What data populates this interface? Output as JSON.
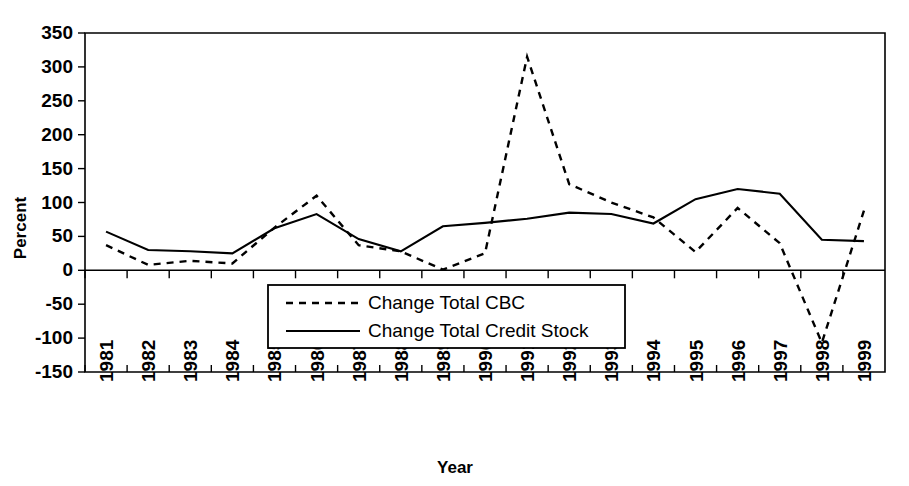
{
  "chart_data": {
    "type": "line",
    "title": "",
    "xlabel": "Year",
    "ylabel": "Percent",
    "categories": [
      "1981",
      "1982",
      "1983",
      "1984",
      "1985",
      "1986",
      "1987",
      "1988",
      "1989",
      "1990",
      "1991",
      "1992",
      "1993",
      "1994",
      "1995",
      "1996",
      "1997",
      "1998",
      "1999"
    ],
    "ylim": [
      -150,
      350
    ],
    "yticks": [
      -150,
      -100,
      -50,
      0,
      50,
      100,
      150,
      200,
      250,
      300,
      350
    ],
    "ytick_labels": [
      "-150",
      "-100",
      "-50",
      "0",
      "50",
      "100",
      "150",
      "200",
      "250",
      "300",
      "350"
    ],
    "grid": false,
    "legend_position": "center-bottom-inside",
    "series": [
      {
        "name": "Change Total CBC",
        "style": "dashed",
        "color": "#000000",
        "values": [
          37,
          8,
          14,
          10,
          63,
          110,
          37,
          28,
          1,
          25,
          315,
          127,
          100,
          78,
          27,
          92,
          40,
          -107,
          88
        ]
      },
      {
        "name": "Change Total Credit Stock",
        "style": "solid",
        "color": "#000000",
        "values": [
          57,
          30,
          28,
          25,
          62,
          83,
          46,
          28,
          65,
          70,
          76,
          85,
          83,
          69,
          105,
          120,
          113,
          45,
          43
        ]
      }
    ]
  },
  "axes": {
    "y_title": "Percent",
    "x_title": "Year"
  },
  "legend": {
    "entries": [
      {
        "label": "Change Total CBC",
        "style": "dashed"
      },
      {
        "label": "Change Total Credit Stock",
        "style": "solid"
      }
    ]
  }
}
